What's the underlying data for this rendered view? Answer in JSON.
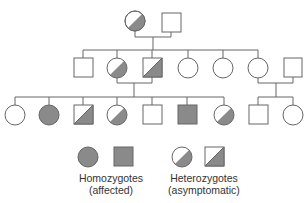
{
  "colors": {
    "line": "#666666",
    "fill": "#8a8a8a",
    "empty": "#ffffff"
  },
  "generations": [
    {
      "label": "I",
      "individuals": [
        {
          "id": "I-1",
          "sex": "female",
          "status": "heterozygote"
        },
        {
          "id": "I-2",
          "sex": "male",
          "status": "unaffected"
        }
      ]
    },
    {
      "label": "II",
      "individuals": [
        {
          "id": "II-1",
          "sex": "male",
          "status": "unaffected"
        },
        {
          "id": "II-2",
          "sex": "female",
          "status": "heterozygote"
        },
        {
          "id": "II-3",
          "sex": "male",
          "status": "heterozygote"
        },
        {
          "id": "II-4",
          "sex": "female",
          "status": "unaffected"
        },
        {
          "id": "II-5",
          "sex": "female",
          "status": "unaffected"
        },
        {
          "id": "II-6",
          "sex": "female",
          "status": "unaffected"
        },
        {
          "id": "II-7",
          "sex": "male",
          "status": "unaffected",
          "married_in": true
        }
      ]
    },
    {
      "label": "III",
      "individuals": [
        {
          "id": "III-1",
          "sex": "female",
          "status": "unaffected"
        },
        {
          "id": "III-2",
          "sex": "female",
          "status": "homozygote"
        },
        {
          "id": "III-3",
          "sex": "male",
          "status": "heterozygote"
        },
        {
          "id": "III-4",
          "sex": "female",
          "status": "heterozygote"
        },
        {
          "id": "III-5",
          "sex": "male",
          "status": "unaffected"
        },
        {
          "id": "III-6",
          "sex": "male",
          "status": "homozygote"
        },
        {
          "id": "III-7",
          "sex": "female",
          "status": "heterozygote"
        },
        {
          "id": "III-8",
          "sex": "male",
          "status": "unaffected"
        },
        {
          "id": "III-9",
          "sex": "female",
          "status": "unaffected"
        }
      ]
    }
  ],
  "legend": {
    "homozygotes": {
      "line1": "Homozygotes",
      "line2": "(affected)"
    },
    "heterozygotes": {
      "line1": "Heterozygotes",
      "line2": "(asymptomatic)"
    }
  }
}
